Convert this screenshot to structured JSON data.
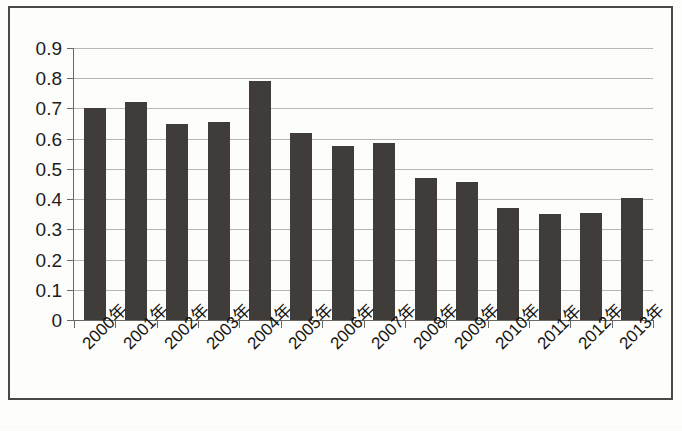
{
  "chart_data": {
    "type": "bar",
    "title": "",
    "subtitle": "",
    "xlabel": "",
    "ylabel": "",
    "categories": [
      "2000年",
      "2001年",
      "2002年",
      "2003年",
      "2004年",
      "2005年",
      "2006年",
      "2007年",
      "2008年",
      "2009年",
      "2010年",
      "2011年",
      "2012年",
      "2013年"
    ],
    "values": [
      0.7,
      0.72,
      0.65,
      0.655,
      0.79,
      0.62,
      0.575,
      0.585,
      0.47,
      0.455,
      0.37,
      0.35,
      0.355,
      0.405
    ],
    "ylim": [
      0,
      0.9
    ],
    "ytick_labels": [
      "0.9",
      "0.8",
      "0.7",
      "0.6",
      "0.5",
      "0.4",
      "0.3",
      "0.2",
      "0.1",
      "0"
    ],
    "ytick_values": [
      0.9,
      0.8,
      0.7,
      0.6,
      0.5,
      0.4,
      0.3,
      0.2,
      0.1,
      0
    ],
    "grid": true,
    "legend": false,
    "legend_position": "none",
    "bar_color": "#403c3a",
    "gridline_color": "#b9b7b4",
    "axis_color": "#6b6864",
    "background_color": "#fdfdfc",
    "frame_color": "#4a4744",
    "xtick_label_rotation": -45
  }
}
